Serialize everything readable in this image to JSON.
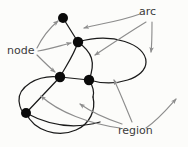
{
  "diagram": {
    "background_color": "#fcfcfa",
    "labels": {
      "node": "node",
      "arc": "arc",
      "region": "region"
    },
    "colors": {
      "node_fill": "#0a0a0a",
      "curve_stroke": "#1a1a1a",
      "pointer_stroke": "#8d8d8d",
      "label_text": "#3b3b3b"
    },
    "nodes": [
      {
        "id": "n1",
        "name": "top-node",
        "x": 63,
        "y": 18,
        "r": 5.0
      },
      {
        "id": "n2",
        "name": "upper-middle-node",
        "x": 78,
        "y": 42,
        "r": 5.2
      },
      {
        "id": "n3",
        "name": "left-center-node",
        "x": 60,
        "y": 77,
        "r": 5.2
      },
      {
        "id": "n4",
        "name": "right-center-node",
        "x": 89,
        "y": 80,
        "r": 5.2
      },
      {
        "id": "n5",
        "name": "bottom-left-node",
        "x": 26,
        "y": 113,
        "r": 5.0
      }
    ],
    "arcs": [
      {
        "id": "a1",
        "name": "arc-n1-n2",
        "d": "M 63 18 L 78 42"
      },
      {
        "id": "a2",
        "name": "arc-n2-n3",
        "d": "M 78 42 C 74 55 66 66 60 77"
      },
      {
        "id": "a3",
        "name": "arc-n3-n4",
        "d": "M 60 77 L 89 80"
      },
      {
        "id": "a4",
        "name": "arc-n2-n4-right-loop",
        "d": "M 78 42 C 112 32 146 44 146 62 C 146 78 116 88 89 80"
      },
      {
        "id": "a5",
        "name": "arc-n2-n4-inner",
        "d": "M 78 42 C 92 52 96 62 89 80"
      },
      {
        "id": "a6",
        "name": "arc-n3-n5-chord",
        "d": "M 60 77 L 26 113"
      },
      {
        "id": "a7",
        "name": "arc-n3-n5-left-circle",
        "d": "M 60 77 C 36 74 18 88 19 101 C 20 110 22 113 26 113"
      },
      {
        "id": "a8",
        "name": "arc-n5-bottom-circle",
        "d": "M 26 113 C 34 131 58 138 76 130 C 90 124 96 110 93 97"
      },
      {
        "id": "a9",
        "name": "arc-n4-bottom-right",
        "d": "M 89 80 C 94 88 94 94 93 97"
      },
      {
        "id": "a10",
        "name": "arc-n5-lower-sweep",
        "d": "M 26 113 C 48 125 72 130 100 122"
      }
    ],
    "pointers": [
      {
        "id": "p1",
        "name": "node-pointer-to-top-node",
        "from_label": "node",
        "d": "M 37 48 C 44 34 52 26 58 21"
      },
      {
        "id": "p2",
        "name": "node-pointer-to-upper-middle-node",
        "from_label": "node",
        "d": "M 38 51 C 52 49 62 45 71 43"
      },
      {
        "id": "p3",
        "name": "node-pointer-to-left-center-node",
        "from_label": "node",
        "d": "M 37 55 C 44 62 50 68 55 72"
      },
      {
        "id": "p4",
        "name": "arc-pointer-to-n1-n2-edge",
        "from_label": "arc",
        "d": "M 140 14 C 118 22 98 24 84 28"
      },
      {
        "id": "p5",
        "name": "arc-pointer-to-inner-arc",
        "from_label": "arc",
        "d": "M 146 22 C 128 33 110 45 95 55"
      },
      {
        "id": "p6",
        "name": "arc-pointer-to-right-loop",
        "from_label": "arc",
        "d": "M 152 22 C 152 34 152 44 151 52"
      },
      {
        "id": "p7",
        "name": "region-pointer-to-left-circle",
        "from_label": "region",
        "d": "M 120 128 C 90 124 58 112 41 96"
      },
      {
        "id": "p8",
        "name": "region-pointer-to-lower-region",
        "from_label": "region",
        "d": "M 122 124 C 110 120 94 114 80 104"
      },
      {
        "id": "p9",
        "name": "region-pointer-to-right-loop-region",
        "from_label": "region",
        "d": "M 132 122 C 126 108 120 92 114 80"
      },
      {
        "id": "p10",
        "name": "region-pointer-to-outer-region",
        "from_label": "region",
        "d": "M 146 128 C 158 120 168 108 176 99"
      }
    ]
  }
}
